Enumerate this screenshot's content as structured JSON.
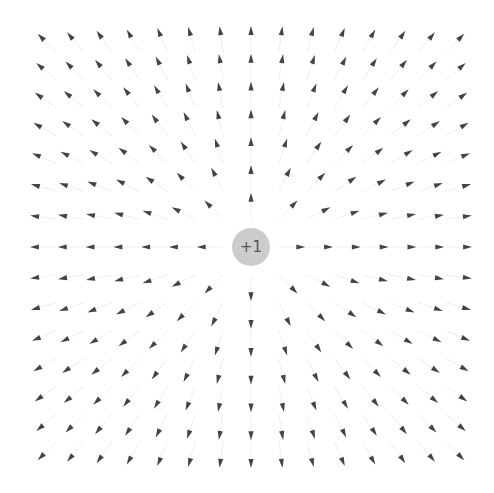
{
  "diagram": {
    "type": "electric-field-vector-plot",
    "width": 494,
    "height": 493,
    "center": {
      "x": 251,
      "y": 247
    },
    "grid": {
      "half_count": 7,
      "spacing": 27.8,
      "arrow_offset": 22,
      "arrow_length": 9,
      "arrow_half_width": 2.6,
      "arrow_color": "#444444",
      "guide_line_color": "#eeeeee"
    },
    "charge": {
      "label": "+1",
      "value": 1,
      "radius": 19,
      "fill": "#cccccc",
      "text_color": "#555555"
    },
    "field_direction": "outward"
  }
}
